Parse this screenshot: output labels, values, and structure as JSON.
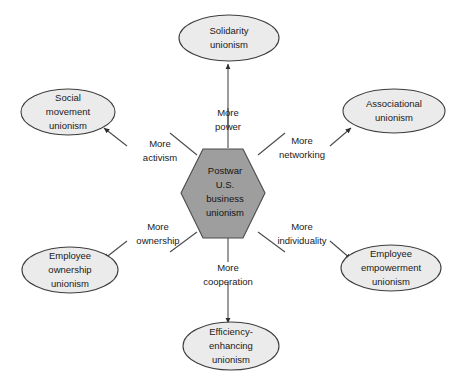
{
  "diagram": {
    "type": "radial-hub-and-spoke",
    "colors": {
      "hub_fill": "#9e9e9e",
      "node_fill": "#ebebeb",
      "stroke": "#4a4a4a",
      "text": "#1a1a1a",
      "background": "#ffffff"
    },
    "center": {
      "shape": "hexagon",
      "lines": [
        "Postwar",
        "U.S.",
        "business",
        "unionism"
      ]
    },
    "nodes": [
      {
        "id": "solidarity",
        "position": "top",
        "shape": "ellipse",
        "lines": [
          "Solidarity",
          "unionism"
        ]
      },
      {
        "id": "associational",
        "position": "top-right",
        "shape": "ellipse",
        "lines": [
          "Associational",
          "unionism"
        ]
      },
      {
        "id": "employee-empowerment",
        "position": "bottom-right",
        "shape": "ellipse",
        "lines": [
          "Employee",
          "empowerment",
          "unionism"
        ]
      },
      {
        "id": "efficiency-enhancing",
        "position": "bottom",
        "shape": "ellipse",
        "lines": [
          "Efficiency-",
          "enhancing",
          "unionism"
        ]
      },
      {
        "id": "employee-ownership",
        "position": "bottom-left",
        "shape": "ellipse",
        "lines": [
          "Employee",
          "ownership",
          "unionism"
        ]
      },
      {
        "id": "social-movement",
        "position": "top-left",
        "shape": "ellipse",
        "lines": [
          "Social",
          "movement",
          "unionism"
        ]
      }
    ],
    "edges": [
      {
        "id": "edge-power",
        "from": "center",
        "to": "solidarity",
        "lines": [
          "More",
          "power"
        ]
      },
      {
        "id": "edge-networking",
        "from": "center",
        "to": "associational",
        "lines": [
          "More",
          "networking"
        ]
      },
      {
        "id": "edge-individuality",
        "from": "center",
        "to": "employee-empowerment",
        "lines": [
          "More",
          "individuality"
        ]
      },
      {
        "id": "edge-cooperation",
        "from": "center",
        "to": "efficiency-enhancing",
        "lines": [
          "More",
          "cooperation"
        ]
      },
      {
        "id": "edge-ownership",
        "from": "center",
        "to": "employee-ownership",
        "lines": [
          "More",
          "ownership"
        ]
      },
      {
        "id": "edge-activism",
        "from": "center",
        "to": "social-movement",
        "lines": [
          "More",
          "activism"
        ]
      }
    ]
  }
}
